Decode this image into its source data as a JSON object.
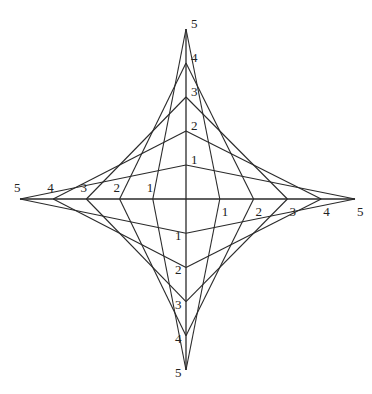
{
  "diagram": {
    "center": {
      "x": 186,
      "y": 199
    },
    "stroke_color": "#2a2a2a",
    "divisions": 5,
    "axes": {
      "up": {
        "length": 170,
        "labels": [
          "1",
          "2",
          "3",
          "4",
          "5"
        ]
      },
      "down": {
        "length": 171,
        "labels": [
          "1",
          "2",
          "3",
          "4",
          "5"
        ]
      },
      "left": {
        "length": 166,
        "labels": [
          "1",
          "2",
          "3",
          "4",
          "5"
        ]
      },
      "right": {
        "length": 169,
        "labels": [
          "1",
          "2",
          "3",
          "4",
          "5"
        ]
      }
    },
    "connection_rule": "point k on one axis joined to point (6-k) on the adjacent axis"
  }
}
